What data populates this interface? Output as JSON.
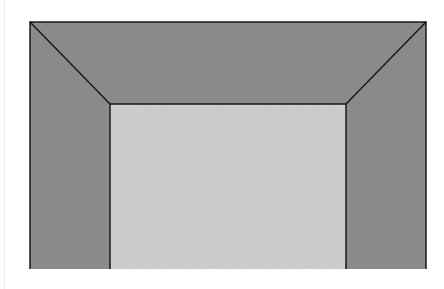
{
  "diagram": {
    "outer_rect": {
      "x": 30,
      "y": 22,
      "width": 396,
      "height": 247
    },
    "inner_rect": {
      "x": 110,
      "y": 104,
      "width": 236,
      "height": 165
    },
    "colors": {
      "frame_fill": "#8a8a8a",
      "inner_fill": "#cdcdcd",
      "stroke": "#1a1a1a",
      "background": "#ffffff"
    }
  }
}
